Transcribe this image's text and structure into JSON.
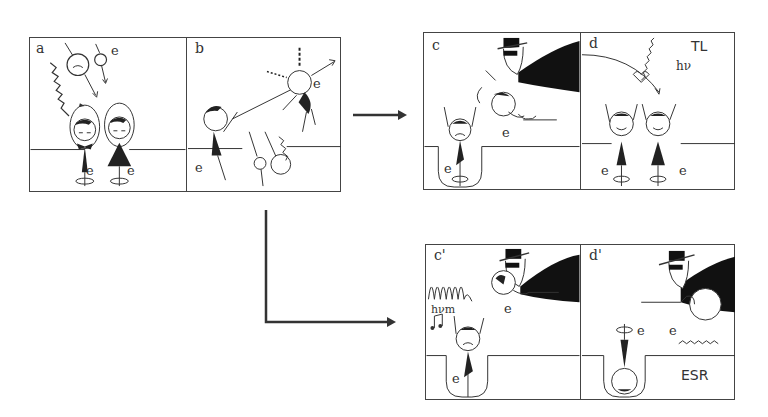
{
  "figure": {
    "groups": [
      {
        "id": "initial",
        "panels": [
          {
            "label": "a",
            "electron_labels": [
              "e",
              "e",
              "e"
            ],
            "description": "Incoming radiation (wavy arrow) and charged particles create paired electrons; two happy figures rest in a surface level"
          },
          {
            "label": "b",
            "electron_labels": [
              "e",
              "e"
            ],
            "description": "Electron ejected upward out of the trap; angry figures collide"
          }
        ]
      },
      {
        "id": "branch-TL",
        "panels": [
          {
            "label": "c",
            "electron_labels": [
              "e",
              "e"
            ],
            "description": "Black-hat figure carries an electron away while a sad figure sits in a trap well"
          },
          {
            "label": "d",
            "tag": "TL",
            "photon_label": "hν",
            "electron_labels": [
              "e",
              "e"
            ],
            "description": "Electron returns and recombines; light (hν) emitted — thermoluminescence"
          }
        ]
      },
      {
        "id": "branch-ESR",
        "panels": [
          {
            "label": "c'",
            "photon_label": "hνm",
            "electron_labels": [
              "e",
              "e"
            ],
            "description": "Microwave irradiation (hνm) with music note; electron in trap well"
          },
          {
            "label": "d'",
            "tag": "ESR",
            "electron_labels": [
              "e",
              "e"
            ],
            "description": "Trapped electron flipped upside down in the well — electron spin resonance"
          }
        ]
      }
    ],
    "arrows": [
      {
        "from": "initial",
        "to": "branch-TL",
        "shape": "straight"
      },
      {
        "from": "initial",
        "to": "branch-ESR",
        "shape": "L-bend"
      }
    ],
    "colors": {
      "ink": "#1a1a1a",
      "border": "#444444",
      "background": "#ffffff"
    }
  }
}
